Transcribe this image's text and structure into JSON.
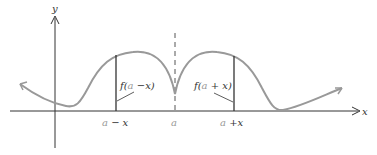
{
  "diagram": {
    "axes": {
      "x_label": "x",
      "y_label": "y"
    },
    "ticks": {
      "left": {
        "a": "a",
        "op": " −",
        "x": "x"
      },
      "center": {
        "a": "a"
      },
      "right": {
        "a": "a",
        "op": " +",
        "x": "x"
      }
    },
    "labels": {
      "left": {
        "f": "f(",
        "a": "a",
        "rest": " −x)"
      },
      "right": {
        "f": "f(",
        "a": "a",
        "rest": " + x)"
      }
    },
    "colors": {
      "curve": "#999999",
      "axes": "#333333",
      "segments": "#333333",
      "symmetry_line": "#555555",
      "a_symbol": "#999999"
    }
  }
}
